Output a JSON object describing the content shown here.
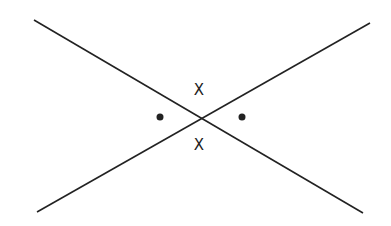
{
  "diagram": {
    "stroke_color": "#222222",
    "lines": [
      {
        "name": "line-descending",
        "x1": 34,
        "y1": 20,
        "x2": 363,
        "y2": 213
      },
      {
        "name": "line-ascending",
        "x1": 37,
        "y1": 212,
        "x2": 370,
        "y2": 23
      }
    ],
    "intersection": {
      "x": 201,
      "y": 120
    },
    "labels": [
      {
        "name": "angle-label-top",
        "text": "X",
        "x": 199,
        "y": 95
      },
      {
        "name": "angle-label-bottom",
        "text": "X",
        "x": 199,
        "y": 150
      }
    ],
    "dots": [
      {
        "name": "angle-dot-left",
        "cx": 160,
        "cy": 117,
        "r": 3.5
      },
      {
        "name": "angle-dot-right",
        "cx": 242,
        "cy": 117,
        "r": 3.5
      }
    ]
  }
}
